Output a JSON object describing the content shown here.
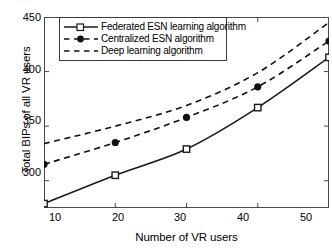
{
  "chart_data": {
    "type": "line",
    "title": "",
    "xlabel": "Number of VR users",
    "ylabel": "Total BIPs of all VR users",
    "x": [
      10,
      20,
      30,
      40,
      50
    ],
    "xlim": [
      10,
      50
    ],
    "ylim": [
      275,
      450
    ],
    "xticks": [
      10,
      20,
      30,
      40,
      50
    ],
    "yticks": [
      300,
      350,
      400,
      450
    ],
    "xticklabels": [
      "10",
      "20",
      "30",
      "40",
      "50"
    ],
    "yticklabels": [
      "300",
      "350",
      "400",
      "450"
    ],
    "grid": false,
    "legend_position": "upper left",
    "series": [
      {
        "name": "Federated ESN learning algorithm",
        "values": [
          279,
          305,
          329,
          367,
          413
        ],
        "linestyle": "solid",
        "marker": "square",
        "color": "#1a1a1a"
      },
      {
        "name": "Centralized ESN algorithm",
        "values": [
          315,
          335,
          358,
          386,
          428
        ],
        "linestyle": "dashed",
        "marker": "circle",
        "color": "#111111"
      },
      {
        "name": "Deep learning algorithm",
        "values": [
          334,
          350,
          369,
          399,
          445
        ],
        "linestyle": "dashed",
        "marker": "none",
        "color": "#111111"
      }
    ]
  },
  "axes": {
    "xlabel": "Number of VR users",
    "ylabel": "Total BIPs of all VR users",
    "xticklabels": [
      "10",
      "20",
      "30",
      "40",
      "50"
    ],
    "yticklabels": [
      "300",
      "350",
      "400",
      "450"
    ]
  },
  "legend": {
    "items": [
      {
        "label": "Federated ESN learning algorithm"
      },
      {
        "label": "Centralized ESN algorithm"
      },
      {
        "label": "Deep learning algorithm"
      }
    ]
  }
}
